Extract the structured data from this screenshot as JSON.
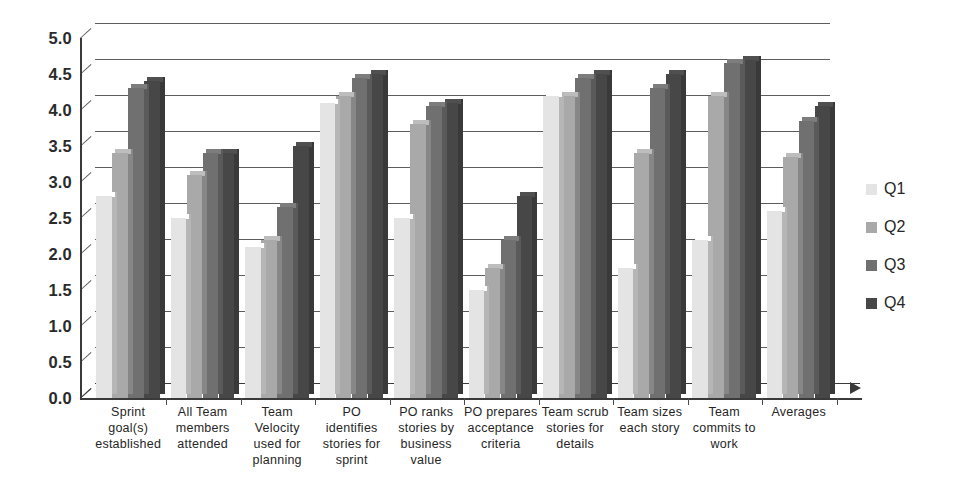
{
  "chart_data": {
    "type": "bar",
    "title": "",
    "subtitle": "",
    "xlabel": "",
    "ylabel": "",
    "ylim": [
      0.0,
      5.0
    ],
    "ytick_step": 0.5,
    "ytick_labels": [
      "5.0",
      "4.5",
      "4.0",
      "3.5",
      "3.0",
      "2.5",
      "2.0",
      "1.5",
      "1.0",
      "0.5",
      "0.0"
    ],
    "ytick_values": [
      5.0,
      4.5,
      4.0,
      3.5,
      3.0,
      2.5,
      2.0,
      1.5,
      1.0,
      0.5,
      0.0
    ],
    "grid": true,
    "grid_axis": "y",
    "legend_position": "right",
    "three_d": true,
    "categories": [
      "Sprint goal(s) established",
      "All Team members attended",
      "Team Velocity used for planning",
      "PO identifies stories for sprint",
      "PO ranks stories by business value",
      "PO prepares acceptance criteria",
      "Team scrub stories for details",
      "Team sizes each story",
      "Team commits to work",
      "Averages"
    ],
    "category_lines": [
      [
        "Sprint",
        "goal(s)",
        "established"
      ],
      [
        "All Team",
        "members",
        "attended"
      ],
      [
        "Team",
        "Velocity",
        "used for",
        "planning"
      ],
      [
        "PO",
        "identifies",
        "stories for",
        "sprint"
      ],
      [
        "PO ranks",
        "stories by",
        "business",
        "value"
      ],
      [
        "PO prepares",
        "acceptance",
        "criteria"
      ],
      [
        "Team scrub",
        "stories for",
        "details"
      ],
      [
        "Team sizes",
        "each story"
      ],
      [
        "Team",
        "commits to",
        "work"
      ],
      [
        "Averages"
      ]
    ],
    "series": [
      {
        "name": "Q1",
        "color": "#e4e4e4",
        "values": [
          2.8,
          2.5,
          2.1,
          4.1,
          2.5,
          1.5,
          4.2,
          1.8,
          2.2,
          2.6
        ]
      },
      {
        "name": "Q2",
        "color": "#a9a9a9",
        "values": [
          3.4,
          3.1,
          2.2,
          4.2,
          3.8,
          1.8,
          4.2,
          3.4,
          4.2,
          3.35
        ]
      },
      {
        "name": "Q3",
        "color": "#707070",
        "values": [
          4.3,
          3.4,
          2.65,
          4.45,
          4.05,
          2.2,
          4.45,
          4.3,
          4.65,
          3.85
        ]
      },
      {
        "name": "Q4",
        "color": "#474747",
        "values": [
          4.4,
          3.4,
          3.5,
          4.5,
          4.1,
          2.8,
          4.5,
          4.5,
          4.7,
          4.05
        ]
      }
    ]
  },
  "legend": {
    "items": [
      {
        "label": "Q1",
        "color": "#e4e4e4"
      },
      {
        "label": "Q2",
        "color": "#a9a9a9"
      },
      {
        "label": "Q3",
        "color": "#707070"
      },
      {
        "label": "Q4",
        "color": "#474747"
      }
    ]
  },
  "axes": {
    "y_min_label": "0.0",
    "y_max_label": "5.0"
  }
}
